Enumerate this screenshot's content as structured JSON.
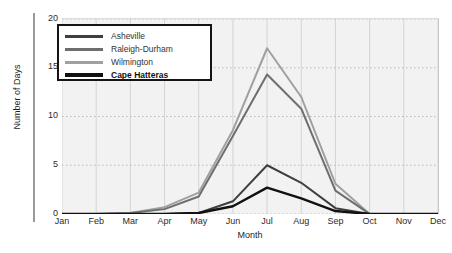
{
  "chart_data": {
    "type": "line",
    "title": "",
    "xlabel": "Month",
    "ylabel": "Number of Days",
    "categories": [
      "Jan",
      "Feb",
      "Mar",
      "Apr",
      "May",
      "Jun",
      "Jul",
      "Aug",
      "Sep",
      "Oct",
      "Nov",
      "Dec"
    ],
    "xticklabels": [
      "Jan",
      "Feb",
      "Mar",
      "Apr",
      "May",
      "Jun",
      "Jul",
      "Aug",
      "Sep",
      "Oct",
      "Nov",
      "Dec"
    ],
    "yticklabels": [
      "0",
      "5",
      "10",
      "15",
      "20"
    ],
    "yticks": [
      0,
      5,
      10,
      15,
      20
    ],
    "ylim": [
      0,
      20
    ],
    "grid": true,
    "legend_position": "upper-left",
    "series": [
      {
        "name": "Asheville",
        "color": "#3f3f3f",
        "values": [
          0,
          0,
          0,
          0,
          0.1,
          1.3,
          5.0,
          3.2,
          0.6,
          0,
          0,
          0
        ]
      },
      {
        "name": "Raleigh-Durham",
        "color": "#6e6e6e",
        "values": [
          0,
          0,
          0.1,
          0.5,
          1.8,
          8.0,
          14.3,
          10.8,
          2.4,
          0,
          0,
          0
        ]
      },
      {
        "name": "Wilmington",
        "color": "#a0a0a0",
        "values": [
          0,
          0,
          0.1,
          0.7,
          2.2,
          8.6,
          17.0,
          12.0,
          3.1,
          0,
          0,
          0
        ]
      },
      {
        "name": "Cape Hatteras",
        "color": "#111111",
        "values": [
          0,
          0,
          0,
          0,
          0.1,
          0.8,
          2.7,
          1.6,
          0.3,
          0,
          0,
          0
        ]
      }
    ]
  },
  "legend": {
    "items": [
      {
        "label": "Asheville",
        "swatch_color": "#3f3f3f",
        "bold": false
      },
      {
        "label": "Raleigh-Durham",
        "swatch_color": "#6e6e6e",
        "bold": false
      },
      {
        "label": "Wilmington",
        "swatch_color": "#a0a0a0",
        "bold": false
      },
      {
        "label": "Cape Hatteras",
        "swatch_color": "#111111",
        "bold": true
      }
    ]
  }
}
